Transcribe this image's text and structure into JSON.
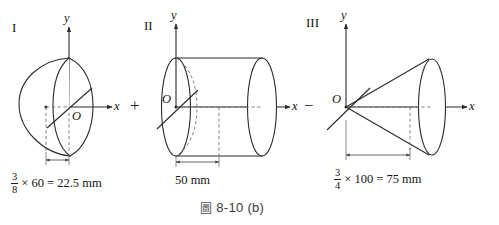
{
  "figure": {
    "caption_glyph": "圖",
    "caption_text": "8-10 (b)"
  },
  "parts": [
    {
      "id": "I",
      "roman": "I",
      "shape": "hemisphere",
      "axis_y_label": "y",
      "axis_x_label": "x",
      "origin_label": "O",
      "dimension": {
        "numerator": "3",
        "denominator": "8",
        "expression": "× 60 = 22.5 mm",
        "value": 22.5,
        "unit": "mm",
        "base_value": 60,
        "fraction": "3/8"
      }
    },
    {
      "id": "II",
      "roman": "II",
      "shape": "cylinder",
      "axis_y_label": "y",
      "axis_x_label": "x",
      "origin_label": "O",
      "dimension": {
        "numerator": "",
        "denominator": "",
        "expression": "50 mm",
        "value": 50,
        "unit": "mm",
        "base_value": 50,
        "fraction": ""
      }
    },
    {
      "id": "III",
      "roman": "III",
      "shape": "cone",
      "axis_y_label": "y",
      "axis_x_label": "x",
      "origin_label": "O",
      "dimension": {
        "numerator": "3",
        "denominator": "4",
        "expression": "× 100 = 75 mm",
        "value": 75,
        "unit": "mm",
        "base_value": 100,
        "fraction": "3/4"
      }
    }
  ],
  "operators": [
    {
      "symbol": "+",
      "between": "I-II"
    },
    {
      "symbol": "−",
      "between": "II-III"
    }
  ],
  "colors": {
    "stroke": "#2b2b2b",
    "dashed": "#6e6e6e",
    "dimension": "#4a4a4a",
    "background": "#ffffff",
    "caption": "#3a3a3a"
  }
}
